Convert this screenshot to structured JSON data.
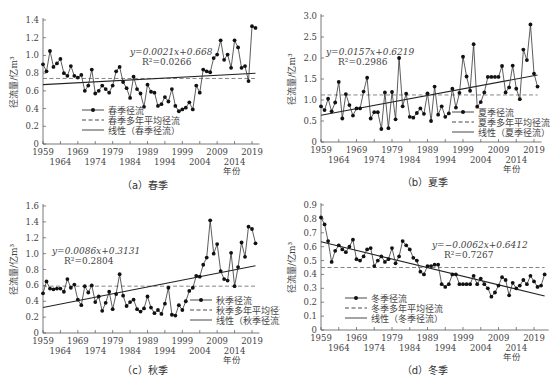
{
  "figure": {
    "x_unit_label": "年份",
    "y_label": "径流量/亿m³"
  },
  "chart_data": [
    {
      "id": "a",
      "type": "line",
      "caption": "（a）春季",
      "title": "",
      "xlabel": "年份",
      "ylabel": "径流量/亿m³",
      "ylim": [
        0,
        1.4
      ],
      "yticks": [
        0,
        0.2,
        0.4,
        0.6,
        0.8,
        1.0,
        1.2,
        1.4
      ],
      "ytick_labels": [
        "0",
        "0.2",
        "0.4",
        "0.6",
        "0.8",
        "1.0",
        "1.2",
        "1.4"
      ],
      "xticks_top": [
        "1959",
        "1969",
        "1979",
        "1989",
        "1999",
        "2009",
        "2019"
      ],
      "xticks_bottom": [
        "1964",
        "1974",
        "1984",
        "1994",
        "2004",
        "2014"
      ],
      "x_start": 1959,
      "series": [
        {
          "name": "春季径流",
          "style": "line-marker",
          "values": [
            0.9,
            0.82,
            1.05,
            0.87,
            0.91,
            0.96,
            0.8,
            0.77,
            0.88,
            0.77,
            0.75,
            0.78,
            0.6,
            0.66,
            0.84,
            0.57,
            0.6,
            0.66,
            0.62,
            0.58,
            0.66,
            0.82,
            0.87,
            0.7,
            0.63,
            0.52,
            0.76,
            0.62,
            0.57,
            0.42,
            0.67,
            0.59,
            0.58,
            0.43,
            0.45,
            0.53,
            0.48,
            0.62,
            0.43,
            0.37,
            0.39,
            0.41,
            0.47,
            0.39,
            0.66,
            0.58,
            0.84,
            0.82,
            0.81,
            0.97,
            1.01,
            1.17,
            0.95,
            1.01,
            0.86,
            1.17,
            1.09,
            0.86,
            0.88,
            0.71,
            1.33,
            1.31
          ]
        },
        {
          "name": "春季多年平均径流",
          "style": "dashed",
          "value": 0.74
        },
        {
          "name": "线性（春季径流）",
          "style": "solid",
          "slope": 0.0021,
          "intercept": 0.668
        }
      ],
      "equation": "y=0.0021x+0.668",
      "r2": "R²=0.0266",
      "legend": [
        "春季径流",
        "春季多年平均径流",
        "线性（春季径流）"
      ],
      "legend_position": "lower-center"
    },
    {
      "id": "b",
      "type": "line",
      "caption": "（b）夏季",
      "title": "",
      "xlabel": "年份",
      "ylabel": "径流量/亿m³",
      "ylim": [
        0,
        3.0
      ],
      "yticks": [
        0,
        0.5,
        1.0,
        1.5,
        2.0,
        2.5,
        3.0
      ],
      "ytick_labels": [
        "0",
        "0.5",
        "1.0",
        "1.5",
        "2.0",
        "2.5",
        "3.0"
      ],
      "xticks_top": [
        "1959",
        "1969",
        "1979",
        "1989",
        "1999",
        "2009",
        "2019"
      ],
      "xticks_bottom": [
        "1964",
        "1974",
        "1984",
        "1994",
        "2004",
        "2014"
      ],
      "x_start": 1959,
      "series": [
        {
          "name": "夏季径流",
          "style": "line-marker",
          "values": [
            0.85,
            0.76,
            1.03,
            0.73,
            0.94,
            1.43,
            0.56,
            1.14,
            0.88,
            0.63,
            0.8,
            0.8,
            1.2,
            1.53,
            0.56,
            0.71,
            0.71,
            0.31,
            1.18,
            0.33,
            1.19,
            0.54,
            2.0,
            0.85,
            1.15,
            0.6,
            0.58,
            0.69,
            0.8,
            0.67,
            1.16,
            0.5,
            1.32,
            0.65,
            0.85,
            0.6,
            0.68,
            1.27,
            0.82,
            1.17,
            2.03,
            1.56,
            1.22,
            2.33,
            0.84,
            0.95,
            1.18,
            1.55,
            1.55,
            1.55,
            1.55,
            1.81,
            1.18,
            1.3,
            1.82,
            1.27,
            1.02,
            2.2,
            1.95,
            2.8,
            1.63,
            1.32
          ]
        },
        {
          "name": "夏季多年平均径流",
          "style": "dashed",
          "value": 1.12
        },
        {
          "name": "线性（夏季径流）",
          "style": "solid",
          "slope": 0.0157,
          "intercept": 0.6219
        }
      ],
      "equation": "y=0.0157x+0.6219",
      "r2": "R²=0.2986",
      "legend": [
        "夏季径流",
        "夏季多年平均径流",
        "线性（夏季径流）"
      ],
      "legend_position": "lower-right"
    },
    {
      "id": "c",
      "type": "line",
      "caption": "（c）秋季",
      "title": "",
      "xlabel": "年份",
      "ylabel": "径流量/亿m³",
      "ylim": [
        0,
        1.6
      ],
      "yticks": [
        0,
        0.2,
        0.4,
        0.6,
        0.8,
        1.0,
        1.2,
        1.4,
        1.6
      ],
      "ytick_labels": [
        "0",
        "0.2",
        "0.4",
        "0.6",
        "0.8",
        "1.0",
        "1.2",
        "1.4",
        "1.6"
      ],
      "xticks_top": [
        "1959",
        "1969",
        "1979",
        "1989",
        "1999",
        "2009",
        "2019"
      ],
      "xticks_bottom": [
        "1964",
        "1974",
        "1984",
        "1994",
        "2004",
        "2014"
      ],
      "x_start": 1959,
      "series": [
        {
          "name": "秋季径流",
          "style": "line-marker",
          "values": [
            0.5,
            0.65,
            0.56,
            0.55,
            0.56,
            0.56,
            0.52,
            0.68,
            0.57,
            0.61,
            0.42,
            0.35,
            0.59,
            0.51,
            0.6,
            0.39,
            0.46,
            0.28,
            0.38,
            0.52,
            0.3,
            0.49,
            0.74,
            0.47,
            0.34,
            0.39,
            0.42,
            0.3,
            0.27,
            0.31,
            0.46,
            0.32,
            0.25,
            0.29,
            0.24,
            0.37,
            0.57,
            0.23,
            0.22,
            0.35,
            0.29,
            0.4,
            0.53,
            0.57,
            0.72,
            0.71,
            0.86,
            0.95,
            1.42,
            1.0,
            1.12,
            0.78,
            0.68,
            0.66,
            1.01,
            0.59,
            0.83,
            1.14,
            0.96,
            1.34,
            1.31,
            1.13
          ]
        },
        {
          "name": "秋季多年平均径流",
          "style": "dashed",
          "value": 0.59
        },
        {
          "name": "线性（秋季径流）",
          "style": "solid",
          "slope": 0.0086,
          "intercept": 0.3131
        }
      ],
      "equation": "y=0.0086x+0.3131",
      "r2": "R²=0.2804",
      "legend": [
        "秋季径流",
        "秋季多年平均径流",
        "线性（秋季径流）"
      ],
      "legend_position": "lower-right"
    },
    {
      "id": "d",
      "type": "line",
      "caption": "（d）冬季",
      "title": "",
      "xlabel": "年份",
      "ylabel": "径流量/亿m³",
      "ylim": [
        0,
        0.9
      ],
      "yticks": [
        0,
        0.1,
        0.2,
        0.3,
        0.4,
        0.5,
        0.6,
        0.7,
        0.8,
        0.9
      ],
      "ytick_labels": [
        "0",
        "0.1",
        "0.2",
        "0.3",
        "0.4",
        "0.5",
        "0.6",
        "0.7",
        "0.8",
        "0.9"
      ],
      "xticks_top": [
        "1959",
        "1969",
        "1979",
        "1989",
        "1999",
        "2009",
        "2019"
      ],
      "xticks_bottom": [
        "1964",
        "1974",
        "1984",
        "1994",
        "2004",
        "2014"
      ],
      "x_start": 1959,
      "series": [
        {
          "name": "冬季径流",
          "style": "line-marker",
          "values": [
            0.81,
            0.76,
            0.64,
            0.49,
            0.57,
            0.61,
            0.58,
            0.56,
            0.6,
            0.65,
            0.51,
            0.5,
            0.53,
            0.58,
            0.59,
            0.46,
            0.5,
            0.53,
            0.49,
            0.51,
            0.59,
            0.48,
            0.53,
            0.64,
            0.61,
            0.58,
            0.52,
            0.5,
            0.42,
            0.4,
            0.46,
            0.46,
            0.47,
            0.47,
            0.33,
            0.31,
            0.33,
            0.4,
            0.4,
            0.33,
            0.33,
            0.33,
            0.33,
            0.39,
            0.33,
            0.37,
            0.33,
            0.3,
            0.24,
            0.27,
            0.32,
            0.38,
            0.36,
            0.25,
            0.34,
            0.3,
            0.32,
            0.36,
            0.33,
            0.39,
            0.35,
            0.31,
            0.32,
            0.4
          ]
        },
        {
          "name": "冬季多年平均径流",
          "style": "dashed",
          "value": 0.45
        },
        {
          "name": "线性（冬季径流）",
          "style": "solid",
          "slope": -0.0062,
          "intercept": 0.6412
        }
      ],
      "equation": "y=−0.0062x+0.6412",
      "r2": "R²=0.7267",
      "legend": [
        "冬季径流",
        "冬季多年平均径流",
        "线性（冬季径流）"
      ],
      "legend_position": "lower-left"
    }
  ]
}
